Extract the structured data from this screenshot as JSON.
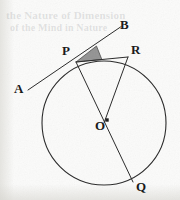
{
  "figure": {
    "kind": "circle-geometry-diagram",
    "background_color": "#fbfbfa",
    "ink_color": "#262626",
    "shade_color": "#8a8a8a",
    "circle": {
      "center_label": "O",
      "cx": 104,
      "cy": 123,
      "r": 62,
      "stroke_width": 1.1
    },
    "points": [
      {
        "id": "A",
        "label": "A",
        "x": 28,
        "y": 90,
        "on_circle": false,
        "marker": false
      },
      {
        "id": "B",
        "label": "B",
        "x": 122,
        "y": 26,
        "on_circle": false,
        "marker": false
      },
      {
        "id": "P",
        "label": "P",
        "x": 76,
        "y": 62,
        "on_circle": true,
        "marker": false
      },
      {
        "id": "R",
        "label": "R",
        "x": 128,
        "y": 57,
        "on_circle": true,
        "marker": false
      },
      {
        "id": "O",
        "label": "O",
        "x": 104,
        "y": 123,
        "on_circle": false,
        "marker": true
      },
      {
        "id": "Q",
        "label": "Q",
        "x": 133,
        "y": 182,
        "on_circle": true,
        "marker": false
      }
    ],
    "segments": [
      {
        "id": "tangent-AB",
        "from": "A",
        "to": "B",
        "role": "tangent-line"
      },
      {
        "id": "chord-PR",
        "from": "P",
        "to": "R",
        "role": "chord"
      },
      {
        "id": "diameter-PQ",
        "from": "P",
        "to": "Q",
        "role": "diameter"
      },
      {
        "id": "radius-OR",
        "from": "O",
        "to": "R",
        "role": "radius"
      }
    ],
    "shaded_angle": {
      "id": "angle-BPR",
      "vertex": "P",
      "ray_1": "B",
      "ray_2": "R",
      "fill": "#8a8a8a",
      "radius": 26
    },
    "center_dot": {
      "cx": 107,
      "cy": 120,
      "size": 3.4
    },
    "ghost_text": {
      "line_1": "the Nature of Dimension",
      "line_2": "of the Mind in Nature"
    }
  }
}
